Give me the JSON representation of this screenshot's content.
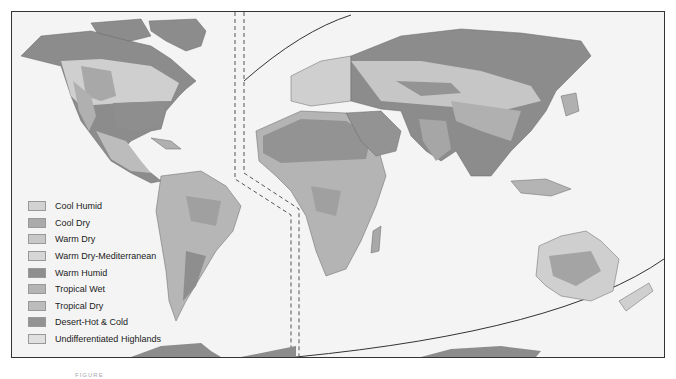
{
  "map": {
    "title": "World Climate Regions",
    "legend": [
      {
        "label": "Cool Humid",
        "color": "#d2d2d2"
      },
      {
        "label": "Cool Dry",
        "color": "#aaaaaa"
      },
      {
        "label": "Warm Dry",
        "color": "#c8c8c8"
      },
      {
        "label": "Warm Dry-Mediterranean",
        "color": "#d6d6d6"
      },
      {
        "label": "Warm Humid",
        "color": "#8e8e8e"
      },
      {
        "label": "Tropical Wet",
        "color": "#b4b4b4"
      },
      {
        "label": "Tropical Dry",
        "color": "#bcbcbc"
      },
      {
        "label": "Desert-Hot & Cold",
        "color": "#939393"
      },
      {
        "label": "Undifferentiated Highlands",
        "color": "#e0e0e0"
      }
    ],
    "caption": "FIGURE"
  }
}
